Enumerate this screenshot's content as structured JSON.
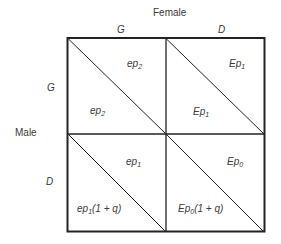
{
  "axes": {
    "column_title": "Female",
    "row_title": "Male",
    "columns": [
      "G",
      "D"
    ],
    "rows": [
      "G",
      "D"
    ]
  },
  "cells": [
    {
      "row": "G",
      "col": "G",
      "upper": {
        "base": "ep",
        "sub": "2",
        "suffix": ""
      },
      "lower": {
        "base": "ep",
        "sub": "2",
        "suffix": ""
      }
    },
    {
      "row": "G",
      "col": "D",
      "upper": {
        "base": "Ep",
        "sub": "1",
        "suffix": ""
      },
      "lower": {
        "base": "Ep",
        "sub": "1",
        "suffix": ""
      }
    },
    {
      "row": "D",
      "col": "G",
      "upper": {
        "base": "ep",
        "sub": "1",
        "suffix": ""
      },
      "lower": {
        "base": "ep",
        "sub": "1",
        "suffix": "(1 + q)"
      }
    },
    {
      "row": "D",
      "col": "D",
      "upper": {
        "base": "Ep",
        "sub": "0",
        "suffix": ""
      },
      "lower": {
        "base": "Ep",
        "sub": "0",
        "suffix": "(1 + q)"
      }
    }
  ],
  "colors": {
    "line": "#222222",
    "text": "#3a3a3a",
    "background": "#ffffff"
  }
}
